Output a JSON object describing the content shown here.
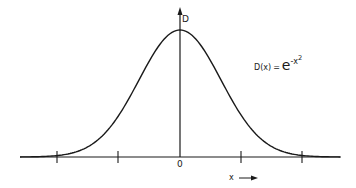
{
  "diagram": {
    "y_axis_label": "D",
    "x_axis_label": "x",
    "x_axis_arrow": "→",
    "origin_label": "0",
    "formula": {
      "lhs": "D(x)",
      "equals": "=",
      "base": "e",
      "exponent": "-x",
      "exponent_power": "2"
    },
    "tick_count": 5,
    "colors": {
      "stroke": "#1a1a1a",
      "background": "#ffffff"
    }
  },
  "chart_data": {
    "type": "line",
    "xlabel": "x",
    "ylabel": "D",
    "x_ticks": [
      "",
      "",
      "0",
      "",
      ""
    ],
    "function": "exp(-x^2)",
    "grid": false,
    "legend": "none"
  }
}
